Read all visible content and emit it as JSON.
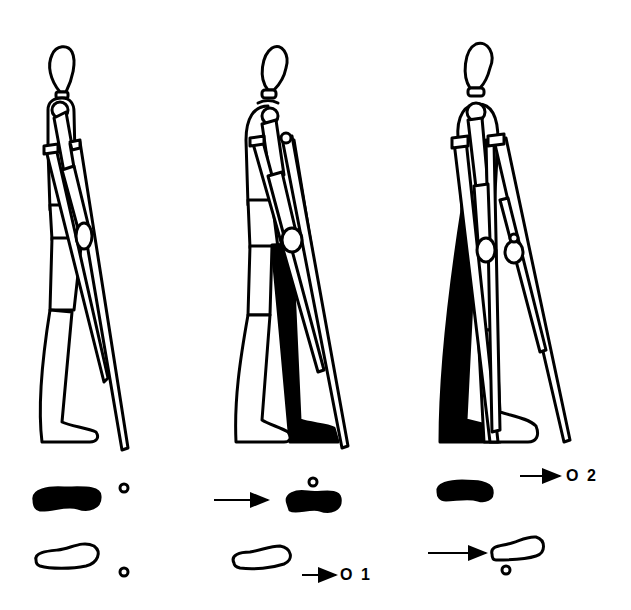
{
  "diagram": {
    "title": "",
    "type": "crutch gait sequence",
    "colors": {
      "ink": "#000000",
      "background": "#ffffff"
    },
    "panels": [
      {
        "index": 1,
        "figure": "standing-figure-with-crutches",
        "shaded_leg": "none",
        "footprints": {
          "top": "filled-left-foot",
          "bottom": "outline-right-foot"
        },
        "crutch_tips": {
          "top": "circle",
          "bottom": "circle"
        },
        "label": ""
      },
      {
        "index": 2,
        "figure": "figure-advancing-crutch-and-shaded-leg",
        "shaded_leg": "rear",
        "footprints": {
          "top": "filled-foot-advanced",
          "bottom": "outline-foot"
        },
        "crutch_tips": {
          "top": "circle-above-filled-foot",
          "bottom": "circle-advanced"
        },
        "arrows": [
          "arrow-to-filled-foot",
          "arrow-to-crutch-tip-1"
        ],
        "label": "O 1"
      },
      {
        "index": 3,
        "figure": "figure-advancing-other-crutch-and-leg",
        "shaded_leg": "rear",
        "footprints": {
          "top": "filled-foot",
          "bottom": "outline-foot-advanced"
        },
        "crutch_tips": {
          "top": "circle-advanced",
          "bottom": "circle-below-outline-foot"
        },
        "arrows": [
          "arrow-to-crutch-tip-2",
          "arrow-to-outline-foot"
        ],
        "label": "O 2"
      }
    ],
    "labels": {
      "step1": "O 1",
      "step2": "O 2"
    }
  }
}
